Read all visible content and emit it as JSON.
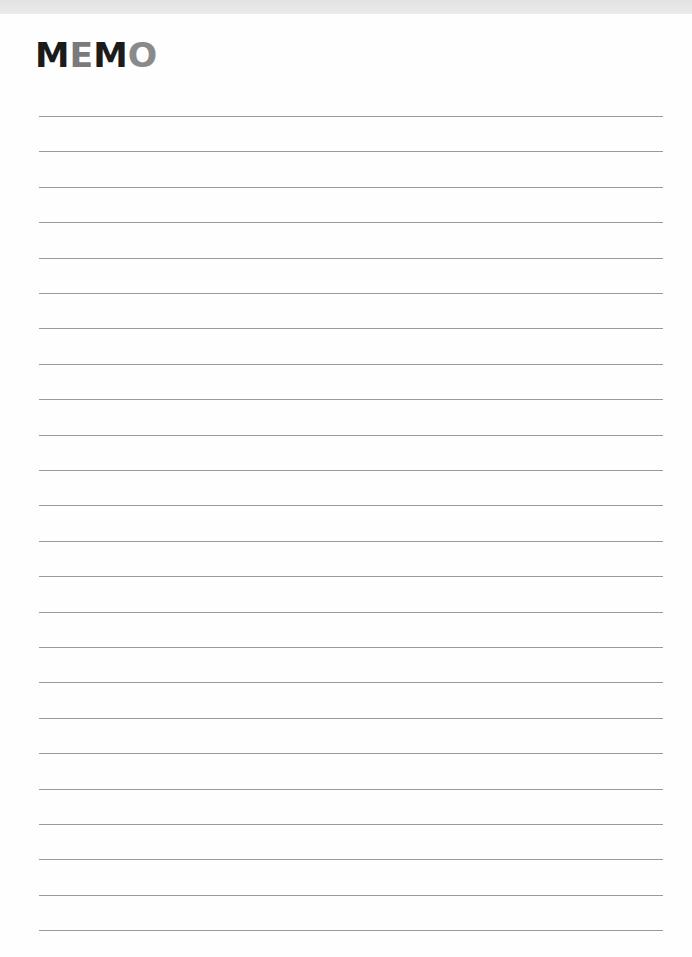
{
  "memo": {
    "title_letters": [
      {
        "char": "M",
        "color": "#1b1b1b"
      },
      {
        "char": "E",
        "color": "#7a7a7a"
      },
      {
        "char": "M",
        "color": "#1b1b1b"
      },
      {
        "char": "O",
        "color": "#8a8a8a"
      }
    ],
    "title": "MEMO",
    "ruled_line_count": 24,
    "ruled_line_first_y": 116,
    "ruled_line_spacing": 35.4,
    "ruled_line_color": "#9a9a9a"
  }
}
